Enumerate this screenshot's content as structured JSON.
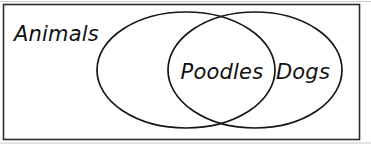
{
  "diagram": {
    "type": "venn",
    "universe": {
      "label": "Animals",
      "name": "universe-label"
    },
    "sets": [
      {
        "id": "animals-set",
        "label": "",
        "cx": 186,
        "cy": 70,
        "rx": 89,
        "ry": 58
      },
      {
        "id": "dogs-set",
        "label": "Dogs",
        "cx": 255,
        "cy": 70,
        "rx": 87,
        "ry": 58
      }
    ],
    "regions": [
      {
        "id": "intersection-region",
        "label": "Poodles",
        "x": 222,
        "y": 79
      },
      {
        "id": "dogs-only-region",
        "label": "Dogs",
        "x": 303,
        "y": 79
      }
    ],
    "frame": {
      "x": 3,
      "y": 4,
      "width": 357,
      "height": 136
    },
    "colors": {
      "stroke": "#161616",
      "frame_stroke": "#2b2b2b",
      "text": "#111111",
      "background": "#ffffff"
    }
  }
}
